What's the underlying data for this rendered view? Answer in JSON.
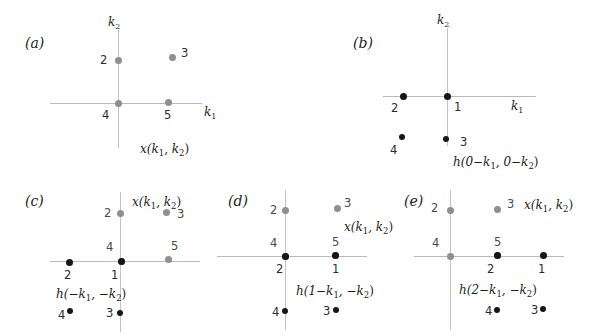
{
  "figure": {
    "title": "",
    "background": "#ffffff",
    "series_colors": {
      "x_signal": "#8f8f8f",
      "h_signal": "#161616",
      "axis": "#bdbdbd"
    },
    "axis_labels": {
      "k1": "k",
      "k1_sub": "1",
      "k2": "k",
      "k2_sub": "2"
    }
  },
  "panels": [
    {
      "tag": "(a)",
      "caption_main": "x(k",
      "caption": "x(k₁, k₂)",
      "axis_k1": "k₁",
      "axis_k2": "k₂",
      "points": [
        {
          "id": "2",
          "series": "x",
          "color": "#8f8f8f"
        },
        {
          "id": "3",
          "series": "x",
          "color": "#8f8f8f"
        },
        {
          "id": "4",
          "series": "x",
          "color": "#8f8f8f"
        },
        {
          "id": "5",
          "series": "x",
          "color": "#8f8f8f"
        }
      ]
    },
    {
      "tag": "(b)",
      "caption": "h(0−k₁, 0−k₂)",
      "axis_k1": "k₁",
      "axis_k2": "k₂",
      "points": [
        {
          "id": "1",
          "series": "h",
          "color": "#161616"
        },
        {
          "id": "2",
          "series": "h",
          "color": "#161616"
        },
        {
          "id": "3",
          "series": "h",
          "color": "#161616"
        },
        {
          "id": "4",
          "series": "h",
          "color": "#161616"
        }
      ]
    },
    {
      "tag": "(c)",
      "caption": "h(−k₁, −k₂)",
      "caption_x": "x(k₁, k₂)",
      "points": [
        {
          "id": "2",
          "series": "x",
          "color": "#8f8f8f"
        },
        {
          "id": "3",
          "series": "x",
          "color": "#8f8f8f"
        },
        {
          "id": "4",
          "series": "x",
          "color": "#8f8f8f"
        },
        {
          "id": "5",
          "series": "x",
          "color": "#8f8f8f"
        },
        {
          "id": "1",
          "series": "h",
          "color": "#161616"
        },
        {
          "id": "2",
          "series": "h",
          "color": "#161616"
        },
        {
          "id": "3",
          "series": "h",
          "color": "#161616"
        },
        {
          "id": "4",
          "series": "h",
          "color": "#161616"
        }
      ]
    },
    {
      "tag": "(d)",
      "caption": "h(1−k₁, −k₂)",
      "caption_x": "x(k₁, k₂)",
      "points": [
        {
          "id": "2",
          "series": "x",
          "color": "#8f8f8f"
        },
        {
          "id": "3",
          "series": "x",
          "color": "#8f8f8f"
        },
        {
          "id": "4",
          "series": "x",
          "color": "#8f8f8f"
        },
        {
          "id": "5",
          "series": "x",
          "color": "#8f8f8f"
        },
        {
          "id": "1",
          "series": "h",
          "color": "#161616"
        },
        {
          "id": "2",
          "series": "h",
          "color": "#161616"
        },
        {
          "id": "3",
          "series": "h",
          "color": "#161616"
        },
        {
          "id": "4",
          "series": "h",
          "color": "#161616"
        }
      ]
    },
    {
      "tag": "(e)",
      "caption": "h(2−k₁, −k₂)",
      "caption_x": "x(k₁, k₂)",
      "points": [
        {
          "id": "2",
          "series": "x",
          "color": "#8f8f8f"
        },
        {
          "id": "3",
          "series": "x",
          "color": "#8f8f8f"
        },
        {
          "id": "4",
          "series": "x",
          "color": "#8f8f8f"
        },
        {
          "id": "5",
          "series": "x",
          "color": "#8f8f8f"
        },
        {
          "id": "1",
          "series": "h",
          "color": "#161616"
        },
        {
          "id": "2",
          "series": "h",
          "color": "#161616"
        },
        {
          "id": "3",
          "series": "h",
          "color": "#161616"
        },
        {
          "id": "4",
          "series": "h",
          "color": "#161616"
        }
      ]
    }
  ],
  "labels": {
    "a_tag": "(a)",
    "a_k2": "k",
    "a_k2_sub": "2",
    "a_k1": "k",
    "a_k1_sub": "1",
    "a_n2": "2",
    "a_n3": "3",
    "a_n4": "4",
    "a_n5": "5",
    "a_caption_x": "x(k",
    "a_caption_s1": "1",
    "a_caption_mid": ", k",
    "a_caption_s2": "2",
    "a_caption_end": ")",
    "b_tag": "(b)",
    "b_k2": "k",
    "b_k2_sub": "2",
    "b_k1": "k",
    "b_k1_sub": "1",
    "b_n1": "1",
    "b_n2": "2",
    "b_n3": "3",
    "b_n4": "4",
    "b_cap_h": "h(0",
    "b_cap_minus1": "−k",
    "b_cap_s1": "1",
    "b_cap_c": ", 0",
    "b_cap_minus2": "−k",
    "b_cap_s2": "2",
    "b_cap_end": ")",
    "c_tag": "(c)",
    "c_gn2": "2",
    "c_gn3": "3",
    "c_gn4": "4",
    "c_gn5": "5",
    "c_bn1": "1",
    "c_bn2": "2",
    "c_bn3": "3",
    "c_bn4": "4",
    "c_cap_x": "x(k",
    "c_cap_xs1": "1",
    "c_cap_xm": ", k",
    "c_cap_xs2": "2",
    "c_cap_xe": ")",
    "c_cap_h": "h(",
    "c_cap_hm1": "−k",
    "c_cap_hs1": "1",
    "c_cap_hc": ", ",
    "c_cap_hm2": "−k",
    "c_cap_hs2": "2",
    "c_cap_he": ")",
    "d_tag": "(d)",
    "d_gn2": "2",
    "d_gn3": "3",
    "d_gn4": "4",
    "d_gn5": "5",
    "d_bn1": "1",
    "d_bn2": "2",
    "d_bn3": "3",
    "d_bn4": "4",
    "d_cap_x": "x(k",
    "d_cap_xs1": "1",
    "d_cap_xm": ", k",
    "d_cap_xs2": "2",
    "d_cap_xe": ")",
    "d_cap_h": "h(1",
    "d_cap_hm1": "−k",
    "d_cap_hs1": "1",
    "d_cap_hc": ", ",
    "d_cap_hm2": "−k",
    "d_cap_hs2": "2",
    "d_cap_he": ")",
    "e_tag": "(e)",
    "e_gn2": "2",
    "e_gn3": "3",
    "e_gn4": "4",
    "e_gn5": "5",
    "e_bn1": "1",
    "e_bn2": "2",
    "e_bn3": "3",
    "e_bn4": "4",
    "e_cap_x": "x(k",
    "e_cap_xs1": "1",
    "e_cap_xm": ", k",
    "e_cap_xs2": "2",
    "e_cap_xe": ")",
    "e_cap_h": "h(2",
    "e_cap_hm1": "−k",
    "e_cap_hs1": "1",
    "e_cap_hc": ", ",
    "e_cap_hm2": "−k",
    "e_cap_hs2": "2",
    "e_cap_he": ")"
  }
}
